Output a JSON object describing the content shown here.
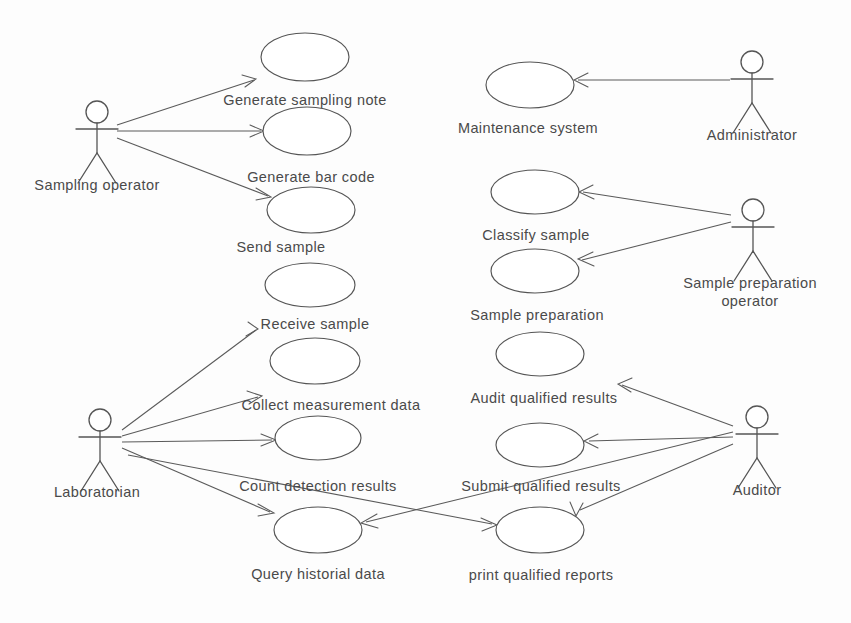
{
  "diagram": {
    "type": "uml-use-case",
    "colors": {
      "background": "#fdfdfd",
      "stroke": "#555555",
      "text": "#4a4a4a"
    },
    "actors": [
      {
        "id": "sampling-operator",
        "label": "Sampling operator",
        "x": 97,
        "y": 112,
        "label_x": 97,
        "label_y": 190
      },
      {
        "id": "administrator",
        "label": "Administrator",
        "x": 752,
        "y": 62,
        "label_x": 752,
        "label_y": 140
      },
      {
        "id": "sample-preparation-operator",
        "label": "Sample preparation",
        "label2": "operator",
        "x": 753,
        "y": 210,
        "label_x": 750,
        "label_y": 288
      },
      {
        "id": "laboratorian",
        "label": "Laboratorian",
        "x": 100,
        "y": 420,
        "label_x": 97,
        "label_y": 497
      },
      {
        "id": "auditor",
        "label": "Auditor",
        "x": 757,
        "y": 417,
        "label_x": 757,
        "label_y": 495
      }
    ],
    "usecases": [
      {
        "id": "generate-sampling-note",
        "label": "Generate sampling note",
        "cx": 305,
        "cy": 57,
        "rx": 44,
        "ry": 24,
        "label_x": 305,
        "label_y": 105
      },
      {
        "id": "generate-bar-code",
        "label": "Generate bar code",
        "cx": 307,
        "cy": 131,
        "rx": 44,
        "ry": 24,
        "label_x": 311,
        "label_y": 182
      },
      {
        "id": "send-sample",
        "label": "Send sample",
        "cx": 311,
        "cy": 210,
        "rx": 44,
        "ry": 23,
        "label_x": 281,
        "label_y": 252
      },
      {
        "id": "receive-sample",
        "label": "Receive sample",
        "cx": 310,
        "cy": 285,
        "rx": 45,
        "ry": 22,
        "label_x": 315,
        "label_y": 329
      },
      {
        "id": "collect-measurement-data",
        "label": "Collect measurement data",
        "cx": 315,
        "cy": 361,
        "rx": 45,
        "ry": 23,
        "label_x": 331,
        "label_y": 410
      },
      {
        "id": "count-detection-results",
        "label": "Count detection results",
        "cx": 318,
        "cy": 438,
        "rx": 43,
        "ry": 22,
        "label_x": 318,
        "label_y": 491
      },
      {
        "id": "query-historial-data",
        "label": "Query historial data",
        "cx": 318,
        "cy": 530,
        "rx": 44,
        "ry": 23,
        "label_x": 318,
        "label_y": 579
      },
      {
        "id": "maintenance-system",
        "label": "Maintenance system",
        "cx": 530,
        "cy": 85,
        "rx": 44,
        "ry": 23,
        "label_x": 528,
        "label_y": 133
      },
      {
        "id": "classify-sample",
        "label": "Classify sample",
        "cx": 535,
        "cy": 192,
        "rx": 44,
        "ry": 22,
        "label_x": 536,
        "label_y": 240
      },
      {
        "id": "sample-preparation",
        "label": "Sample preparation",
        "cx": 535,
        "cy": 271,
        "rx": 44,
        "ry": 22,
        "label_x": 537,
        "label_y": 320
      },
      {
        "id": "audit-qualified-results",
        "label": "Audit qualified results",
        "cx": 540,
        "cy": 354,
        "rx": 44,
        "ry": 22,
        "label_x": 544,
        "label_y": 403
      },
      {
        "id": "submit-qualified-results",
        "label": "Submit qualified results",
        "cx": 540,
        "cy": 445,
        "rx": 44,
        "ry": 22,
        "label_x": 541,
        "label_y": 491
      },
      {
        "id": "print-qualified-reports",
        "label": "print qualified reports",
        "cx": 540,
        "cy": 530,
        "rx": 44,
        "ry": 23,
        "label_x": 541,
        "label_y": 580
      }
    ],
    "associations": [
      {
        "id": "sampling-operator-to-generate-sampling-note",
        "from": "sampling-operator",
        "to": "generate-sampling-note",
        "d": "M 117 125 L 254 80",
        "head": "M 242 75 L 256 79 L 245 87"
      },
      {
        "id": "sampling-operator-to-generate-bar-code",
        "from": "sampling-operator",
        "to": "generate-bar-code",
        "d": "M 117 131 L 261 131",
        "head": "M 250 125 L 264 131 L 250 137"
      },
      {
        "id": "sampling-operator-to-send-sample",
        "from": "sampling-operator",
        "to": "send-sample",
        "d": "M 117 138 L 268 196",
        "head": "M 256 188 L 271 197 L 256 200"
      },
      {
        "id": "administrator-to-maintenance-system",
        "from": "administrator",
        "to": "maintenance-system",
        "d": "M 730 80 L 578 80",
        "head": "M 588 73 L 574 80 L 588 87"
      },
      {
        "id": "sample-prep-operator-to-classify-sample",
        "from": "sample-preparation-operator",
        "to": "classify-sample",
        "d": "M 731 215 L 583 192",
        "head": "M 593 185 L 579 192 L 594 199"
      },
      {
        "id": "sample-prep-operator-to-sample-preparation",
        "from": "sample-preparation-operator",
        "to": "sample-preparation",
        "d": "M 731 222 L 582 260",
        "head": "M 593 252 L 578 259 L 594 266"
      },
      {
        "id": "laboratorian-to-receive-sample",
        "from": "laboratorian",
        "to": "receive-sample",
        "d": "M 122 430 L 256 330",
        "head": "M 248 322 L 258 329 L 246 336"
      },
      {
        "id": "laboratorian-to-collect-measurement-data",
        "from": "laboratorian",
        "to": "collect-measurement-data",
        "d": "M 122 436 L 258 397",
        "head": "M 247 391 L 262 396 L 249 404"
      },
      {
        "id": "laboratorian-to-count-detection-results",
        "from": "laboratorian",
        "to": "count-detection-results",
        "d": "M 122 442 L 272 440",
        "head": "M 261 434 L 276 440 L 261 446"
      },
      {
        "id": "laboratorian-to-query-historial-data",
        "from": "laboratorian",
        "to": "query-historial-data",
        "d": "M 122 448 L 270 512",
        "head": "M 258 504 L 274 513 L 258 516"
      },
      {
        "id": "auditor-to-audit-qualified-results",
        "from": "auditor",
        "to": "audit-qualified-results",
        "d": "M 733 426 L 622 385",
        "head": "M 632 378 L 618 384 L 631 392"
      },
      {
        "id": "auditor-to-submit-qualified-results",
        "from": "auditor",
        "to": "submit-qualified-results",
        "d": "M 733 437 L 589 441",
        "head": "M 598 434 L 584 441 L 598 448"
      },
      {
        "id": "auditor-to-print-qualified-reports",
        "from": "auditor",
        "to": "print-qualified-reports",
        "d": "M 733 444 L 580 510",
        "head": "M 570 502 L 576 516 L 583 503"
      },
      {
        "id": "auditor-to-count-detection-results",
        "from": "auditor",
        "to": "count-detection-results",
        "d": "M 733 432 L 366 522",
        "head": "M 377 514 L 361 523 L 378 528"
      },
      {
        "id": "laboratorian-query-to-submit-qualified",
        "from": "query-historial-data",
        "to": "submit-qualified-results",
        "d": "M 128 455 L 492 524",
        "head": "M 481 518 L 497 525 L 482 531"
      }
    ]
  }
}
